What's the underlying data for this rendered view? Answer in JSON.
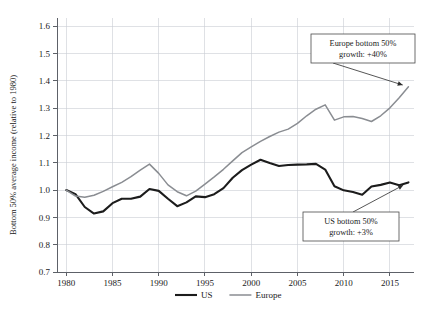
{
  "figure": {
    "background_color": "#ffffff"
  },
  "chart_data": {
    "type": "line",
    "title": "",
    "xlabel": "",
    "ylabel": "Bottom 50% average income (relative to 1980)",
    "xlim": [
      1979.0,
      2017.6
    ],
    "ylim": [
      0.7,
      1.63
    ],
    "yticks": [
      0.7,
      0.8,
      0.9,
      1.0,
      1.1,
      1.2,
      1.3,
      1.4,
      1.5,
      1.6
    ],
    "ytick_labels": [
      "0.7",
      "0.8",
      "0.9",
      "1.0",
      "1.1",
      "1.2",
      "1.3",
      "1.4",
      "1.5",
      "1.6"
    ],
    "xticks": [
      1980,
      1985,
      1990,
      1995,
      2000,
      2005,
      2010,
      2015
    ],
    "xtick_labels": [
      "1980",
      "1985",
      "1990",
      "1995",
      "2000",
      "2005",
      "2010",
      "2015"
    ],
    "grid": true,
    "grid_color": "#c9cdd4",
    "legend_position": "bottom-center",
    "x": [
      1980,
      1981,
      1982,
      1983,
      1984,
      1985,
      1986,
      1987,
      1988,
      1989,
      1990,
      1991,
      1992,
      1993,
      1994,
      1995,
      1996,
      1997,
      1998,
      1999,
      2000,
      2001,
      2002,
      2003,
      2004,
      2005,
      2006,
      2007,
      2008,
      2009,
      2010,
      2011,
      2012,
      2013,
      2014,
      2015,
      2016,
      2017
    ],
    "series": [
      {
        "name": "US",
        "color": "#1c1c1c",
        "line_width": 2.1,
        "values": [
          1.0,
          0.985,
          0.938,
          0.914,
          0.922,
          0.952,
          0.968,
          0.968,
          0.976,
          1.004,
          0.997,
          0.968,
          0.941,
          0.955,
          0.977,
          0.974,
          0.985,
          1.007,
          1.045,
          1.073,
          1.093,
          1.111,
          1.099,
          1.088,
          1.092,
          1.093,
          1.094,
          1.096,
          1.075,
          1.014,
          0.999,
          0.993,
          0.983,
          1.013,
          1.019,
          1.028,
          1.018,
          1.028
        ]
      },
      {
        "name": "Europe",
        "color": "#8a8d92",
        "line_width": 1.5,
        "values": [
          1.0,
          0.978,
          0.974,
          0.981,
          0.995,
          1.012,
          1.028,
          1.049,
          1.073,
          1.095,
          1.061,
          1.019,
          0.994,
          0.979,
          0.996,
          1.022,
          1.048,
          1.076,
          1.107,
          1.137,
          1.158,
          1.178,
          1.196,
          1.212,
          1.223,
          1.244,
          1.272,
          1.296,
          1.312,
          1.256,
          1.268,
          1.269,
          1.262,
          1.251,
          1.272,
          1.301,
          1.338,
          1.378
        ]
      }
    ],
    "annotations": [
      {
        "id": "europe-callout",
        "line1": "Europe bottom 50%",
        "line2": "growth: +40%",
        "target_x": 2017,
        "target_y": 1.378
      },
      {
        "id": "us-callout",
        "line1": "US bottom 50%",
        "line2": "growth: +3%",
        "target_x": 2017,
        "target_y": 1.028
      }
    ]
  },
  "legend": {
    "items": [
      {
        "label": "US",
        "color": "#1c1c1c"
      },
      {
        "label": "Europe",
        "color": "#8a8d92"
      }
    ]
  }
}
